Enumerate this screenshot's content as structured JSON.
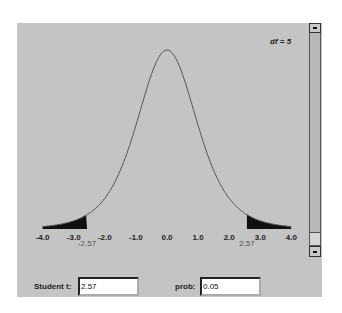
{
  "distribution": {
    "name": "Student t",
    "df_label": "df = 5",
    "df": 5
  },
  "axis": {
    "tick_labels": [
      "-4.0",
      "-3.0",
      "-2.0",
      "-1.0",
      "0.0",
      "1.0",
      "2.0",
      "3.0",
      "4.0"
    ],
    "critical_left_label": "-2.57",
    "critical_right_label": "2.57"
  },
  "controls": {
    "t_label": "Student t:",
    "t_value": "2.57",
    "prob_label": "prob:",
    "prob_value": "0.05"
  },
  "colors": {
    "panel": "#c4c4c4",
    "curve": "#555555",
    "tail_fill": "#111111"
  }
}
